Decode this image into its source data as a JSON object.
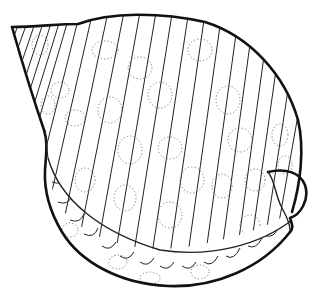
{
  "illustration": {
    "subject": "tun shell line drawing",
    "style": "black ink line art with spiral ribs and dotted circular spots",
    "colors": {
      "background": "#ffffff",
      "ink": "#111111",
      "spots": "#777777"
    },
    "parts": [
      "spire",
      "body-whorl",
      "ribs",
      "spots",
      "outer-lip",
      "aperture-base"
    ]
  }
}
